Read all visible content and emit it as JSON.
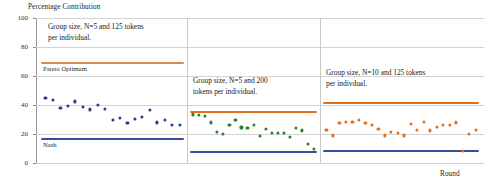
{
  "chart_data": {
    "type": "scatter",
    "title": "",
    "ylabel": "Percentage Contribution",
    "xlabel": "Round",
    "ylim": [
      0,
      100
    ],
    "yticks": [
      0,
      20,
      40,
      60,
      80,
      100
    ],
    "ytick_labels": [
      "0",
      "20",
      "40",
      "60",
      "80",
      "100"
    ],
    "grid": true,
    "legend_position": "none",
    "panels": [
      {
        "name": "panel-1",
        "annotation": "Group size, N=5 and 125 tokens\nper individual.",
        "series": [
          {
            "name": "panel1-contributions",
            "color": "#2B3A8F",
            "values": [
              45,
              43.5,
              38,
              39.5,
              42.5,
              38.5,
              37,
              40,
              37.5,
              29.5,
              31,
              27.5,
              30.5,
              32,
              36.5,
              28,
              30,
              26.5,
              26.5
            ]
          }
        ],
        "reference_lines": [
          {
            "name": "pareto-optimum",
            "label": "Pareto Optimum",
            "value": 70,
            "color": "#E2711D"
          },
          {
            "name": "nash",
            "label": "Nash",
            "value": 17,
            "color": "#3B4CA0"
          }
        ]
      },
      {
        "name": "panel-2",
        "annotation": "Group size, N=5 and 200\ntokens per individual.",
        "series": [
          {
            "name": "panel2-contributions",
            "color": "#2E7D32",
            "values": [
              33.5,
              33,
              32.5,
              28,
              21.5,
              20,
              26,
              30,
              24.5,
              24,
              26,
              18.5,
              23.5,
              21,
              21,
              21,
              18,
              24,
              22.5,
              13,
              9.5
            ]
          }
        ],
        "reference_lines": [
          {
            "name": "pareto-optimum",
            "label": "",
            "value": 36,
            "color": "#E2711D"
          },
          {
            "name": "nash",
            "label": "",
            "value": 8,
            "color": "#3B4CA0"
          }
        ]
      },
      {
        "name": "panel-3",
        "annotation": "Group size, N=10 and 125 tokens\nper indivdual.",
        "series": [
          {
            "name": "panel3-contributions",
            "color": "#E2711D",
            "values": [
              23,
              19,
              27.5,
              28.5,
              28.5,
              30,
              27.5,
              26,
              23.5,
              19,
              21.5,
              20.5,
              19,
              27,
              23,
              28.5,
              22.5,
              25,
              26,
              26.5,
              28,
              8.5,
              20,
              23
            ]
          }
        ],
        "reference_lines": [
          {
            "name": "pareto-optimum",
            "label": "",
            "value": 42,
            "color": "#E2711D"
          },
          {
            "name": "nash",
            "label": "",
            "value": 9,
            "color": "#3B4CA0"
          }
        ]
      }
    ]
  }
}
